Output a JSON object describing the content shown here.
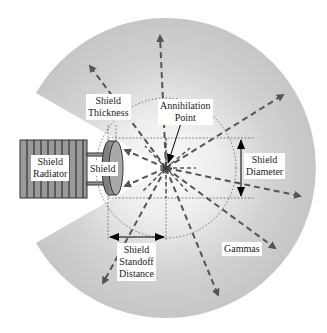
{
  "diagram": {
    "labels": {
      "shield_thickness": [
        "Shield",
        "Thickness"
      ],
      "annihilation_point": [
        "Annihilation",
        "Point"
      ],
      "shield_radiator": [
        "Shield",
        "Radiator"
      ],
      "shield": [
        "Shield"
      ],
      "shield_diameter": [
        "Shield",
        "Diameter"
      ],
      "shield_standoff_distance": [
        "Shield",
        "Standoff",
        "Distance"
      ],
      "gammas": [
        "Gammas"
      ]
    },
    "colors": {
      "outer_disc": "#c8c8c8",
      "inner_glow": "#f4f4f4",
      "arrow": "#555555",
      "radiator_fill": "#9a9a9a",
      "radiator_fins": "#333333",
      "shield_fill": "#8c8c8c",
      "dimension_line": "#000000",
      "dotted_circle": "#555555"
    }
  }
}
